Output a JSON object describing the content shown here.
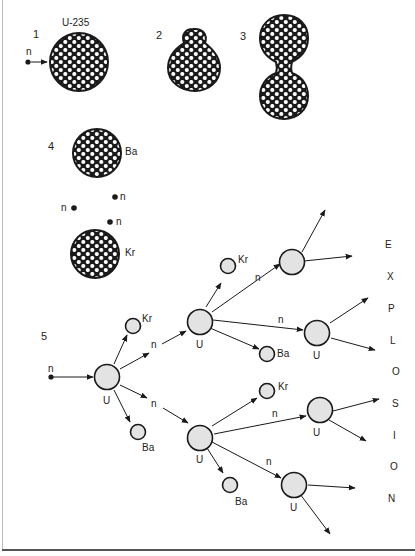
{
  "figure": {
    "colors": {
      "ink": "#1a1a1a",
      "nucleus_fill": "#e3e3e3",
      "background": "#ffffff"
    }
  },
  "steps": [
    {
      "number": "1",
      "nucleus_label": "U-235",
      "neutron_label": "n",
      "description": "neutron approaches U-235 nucleus"
    },
    {
      "number": "2",
      "description": "nucleus deforms"
    },
    {
      "number": "3",
      "description": "nucleus elongates into dumbbell"
    },
    {
      "number": "4",
      "fragments": [
        "Ba",
        "Kr"
      ],
      "neutron_labels": [
        "n",
        "n",
        "n"
      ],
      "description": "splits into Ba and Kr releasing 3 neutrons"
    },
    {
      "number": "5",
      "description": "chain reaction"
    }
  ],
  "chain": {
    "incoming_neutron": "n",
    "first_nucleus": "U",
    "gen1_products": {
      "kr": "Kr",
      "ba": "Ba",
      "n1": "n",
      "n2": "n"
    },
    "upper_branch": {
      "nucleus": "U",
      "kr": "Kr",
      "ba": "Ba",
      "n1": "n",
      "n2": "n",
      "child_labels": [
        "",
        "U"
      ]
    },
    "lower_branch": {
      "nucleus": "U",
      "kr": "Kr",
      "ba": "Ba",
      "n1": "n",
      "n2": "n",
      "child_labels": [
        "U",
        "U"
      ]
    }
  },
  "explosion_word": [
    "E",
    "X",
    "P",
    "L",
    "O",
    "S",
    "I",
    "O",
    "N"
  ]
}
